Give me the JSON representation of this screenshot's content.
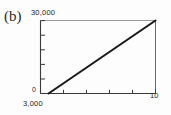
{
  "figure": {
    "panel_label": "(b)",
    "background_color": "#ffffff",
    "ink_color": "#1c1c1c"
  },
  "labels": {
    "y_max": "30,000",
    "y_origin": "0",
    "x_min": "3,000",
    "x_max": "10"
  },
  "chart_data": {
    "type": "line",
    "title": "(b)",
    "xlabel": "",
    "ylabel": "",
    "x": [
      3000,
      10
    ],
    "xlim": [
      3000,
      10
    ],
    "ylim": [
      0,
      30000
    ],
    "x_tick_labels": [
      "3,000",
      "10"
    ],
    "y_tick_labels": [
      "0",
      "30,000"
    ],
    "x_tick_count": 5,
    "y_tick_count": 5,
    "grid": false,
    "legend": null,
    "series": [
      {
        "name": "curve",
        "points": [
          {
            "x_frac": 0.07,
            "y_frac": 0.0
          },
          {
            "x_frac": 1.0,
            "y_frac": 1.0
          }
        ],
        "values": [
          0,
          30000
        ],
        "color": "#1a1a1a",
        "line_width": 2.1
      }
    ],
    "annotations": []
  }
}
